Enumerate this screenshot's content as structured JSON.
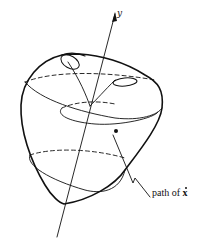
{
  "diagram": {
    "axis_label": "y",
    "annotation": {
      "prefix": "path of ",
      "symbol": "x"
    },
    "colors": {
      "stroke": "#111111",
      "background": "#ffffff"
    }
  }
}
